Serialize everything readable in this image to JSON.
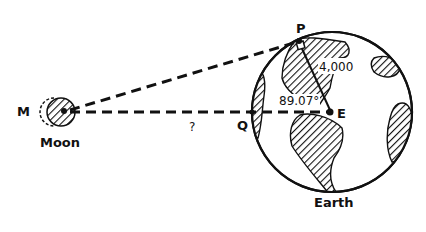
{
  "diagram": {
    "points": {
      "M": "M",
      "P": "P",
      "Q": "Q",
      "E": "E"
    },
    "labels": {
      "moon": "Moon",
      "earth": "Earth",
      "unknown_distance": "?",
      "radius": "4,000",
      "angle": "89.07°"
    },
    "colors": {
      "ink": "#111111",
      "background": "#ffffff"
    }
  }
}
